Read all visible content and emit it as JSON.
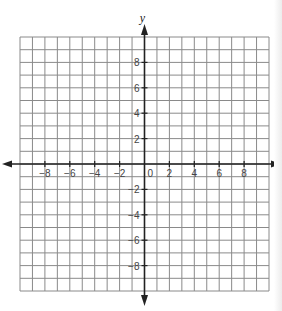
{
  "figure": {
    "type": "coordinate-plane",
    "x_axis": {
      "label": "",
      "min": -10,
      "max": 10,
      "tick_labels": [
        "-8",
        "-6",
        "-4",
        "-2",
        "2",
        "4",
        "6",
        "8"
      ],
      "tick_values": [
        -8,
        -6,
        -4,
        -2,
        2,
        4,
        6,
        8
      ],
      "arrows": "both"
    },
    "y_axis": {
      "label": "y",
      "min": -10,
      "max": 10,
      "tick_labels": [
        "8",
        "6",
        "4",
        "2",
        "-2",
        "-4",
        "-6",
        "-8"
      ],
      "tick_values": [
        8,
        6,
        4,
        2,
        -2,
        -4,
        -6,
        -8
      ],
      "arrows": "both"
    },
    "origin_label": "0",
    "grid": {
      "columns": 20,
      "rows": 20,
      "line_color": "#8a8a8a",
      "axis_color": "#222222"
    }
  }
}
